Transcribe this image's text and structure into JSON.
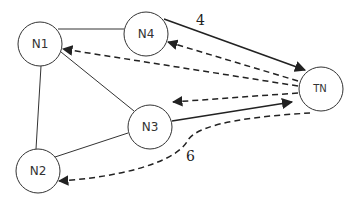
{
  "diagram": {
    "nodes": [
      {
        "id": "N1",
        "label": "N1",
        "cx": 40,
        "cy": 44,
        "r": 22
      },
      {
        "id": "N4",
        "label": "N4",
        "cx": 146,
        "cy": 34,
        "r": 22
      },
      {
        "id": "TN",
        "label": "TN",
        "cx": 321,
        "cy": 89,
        "r": 22
      },
      {
        "id": "N3",
        "label": "N3",
        "cx": 150,
        "cy": 127,
        "r": 22
      },
      {
        "id": "N2",
        "label": "N2",
        "cx": 38,
        "cy": 171,
        "r": 22
      }
    ],
    "edges": [
      {
        "from": "N1",
        "to": "N4",
        "style": "solid",
        "directed": false
      },
      {
        "from": "N1",
        "to": "N2",
        "style": "solid",
        "directed": false
      },
      {
        "from": "N1",
        "to": "N3",
        "style": "solid",
        "directed": false
      },
      {
        "from": "N2",
        "to": "N3",
        "style": "solid",
        "directed": false
      },
      {
        "from": "N4",
        "to": "TN",
        "style": "solid",
        "directed": true,
        "label": "4"
      },
      {
        "from": "N3",
        "to": "TN",
        "style": "solid",
        "directed": true
      },
      {
        "from": "TN",
        "to": "N4",
        "style": "dashed",
        "directed": true
      },
      {
        "from": "TN",
        "to": "N1",
        "style": "dashed",
        "directed": true
      },
      {
        "from": "TN",
        "to": "N3",
        "style": "dashed",
        "directed": true
      },
      {
        "from": "TN",
        "to": "N2",
        "style": "dashed",
        "directed": true,
        "curved": true,
        "label": "6"
      }
    ],
    "edge_labels": {
      "n4_tn": "4",
      "tn_n2": "6"
    },
    "colors": {
      "stroke": "#333333",
      "background": "#ffffff"
    }
  }
}
